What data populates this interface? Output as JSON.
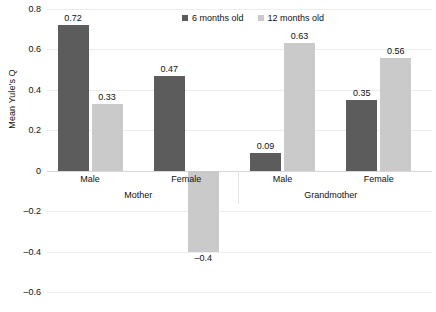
{
  "chart_data": {
    "type": "bar",
    "title": "",
    "subtitle": "",
    "xlabel": "",
    "ylabel": "Mean Yule's Q",
    "ylim": [
      -0.6,
      0.8
    ],
    "ytick_labels": [
      "0.8",
      "0.6",
      "0.4",
      "0.2",
      "0",
      "–0.2",
      "–0.4",
      "–0.6"
    ],
    "ytick_values": [
      0.8,
      0.6,
      0.4,
      0.2,
      0,
      -0.2,
      -0.4,
      -0.6
    ],
    "grid": true,
    "legend_position": "top-center",
    "groups": [
      "Mother",
      "Grandmother"
    ],
    "categories": [
      "Male",
      "Female",
      "Male",
      "Female"
    ],
    "category_group": [
      "Mother",
      "Mother",
      "Grandmother",
      "Grandmother"
    ],
    "series": [
      {
        "name": "6 months old",
        "color": "#5c5c5c",
        "values": [
          0.72,
          0.47,
          0.09,
          0.35
        ],
        "labels": [
          "0.72",
          "0.47",
          "0.09",
          "0.35"
        ]
      },
      {
        "name": "12 months old",
        "color": "#cacaca",
        "values": [
          0.33,
          -0.4,
          0.63,
          0.56
        ],
        "labels": [
          "0.33",
          "–0.4",
          "0.63",
          "0.56"
        ]
      }
    ]
  },
  "legend": {
    "items": [
      {
        "label": "6 months old",
        "color": "#5c5c5c"
      },
      {
        "label": "12 months old",
        "color": "#cacaca"
      }
    ]
  },
  "axes": {
    "y_title": "Mean Yule's Q",
    "y_ticks": [
      {
        "label": "0.8",
        "value": 0.8
      },
      {
        "label": "0.6",
        "value": 0.6
      },
      {
        "label": "0.4",
        "value": 0.4
      },
      {
        "label": "0.2",
        "value": 0.2
      },
      {
        "label": "0",
        "value": 0
      },
      {
        "label": "–0.2",
        "value": -0.2
      },
      {
        "label": "–0.4",
        "value": -0.4
      },
      {
        "label": "–0.6",
        "value": -0.6
      }
    ]
  },
  "x_categories": [
    {
      "label": "Male",
      "group": "Mother"
    },
    {
      "label": "Female",
      "group": "Mother"
    },
    {
      "label": "Male",
      "group": "Grandmother"
    },
    {
      "label": "Female",
      "group": "Grandmother"
    }
  ],
  "x_groups": [
    {
      "label": "Mother"
    },
    {
      "label": "Grandmother"
    }
  ],
  "colors": {
    "series_6_months": "#5c5c5c",
    "series_12_months": "#cacaca",
    "gridline": "#ededed",
    "zero_line": "#d8d8d8",
    "text": "#111111",
    "background": "#ffffff"
  }
}
